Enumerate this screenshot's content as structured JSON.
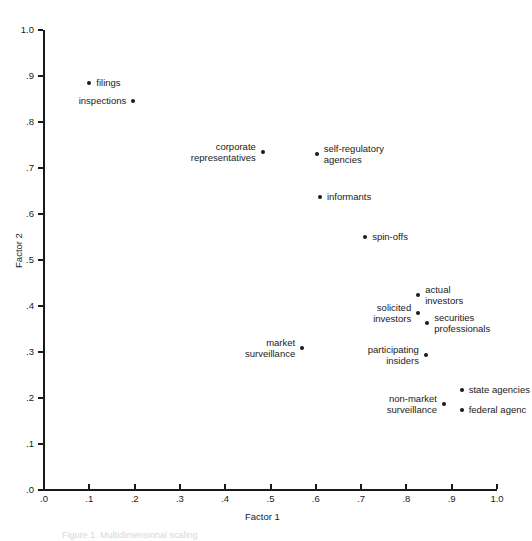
{
  "figure": {
    "caption": "Figure 1. Multidimensional scaling"
  },
  "axes": {
    "x_title": "Factor 1",
    "y_title": "Factor 2",
    "x_ticks": [
      ".0",
      ".1",
      ".2",
      ".3",
      ".4",
      ".5",
      ".6",
      ".7",
      ".8",
      ".9",
      "1.0"
    ],
    "y_ticks": [
      "1.0",
      ".9",
      ".8",
      ".7",
      ".6",
      ".5",
      ".4",
      ".3",
      ".2",
      ".1",
      ".0"
    ],
    "colors": {
      "axis": "#1a1a1a",
      "marker": "#1a1a1a",
      "background": "#ffffff"
    }
  },
  "chart_data": {
    "type": "scatter",
    "title": "",
    "xlabel": "Factor 1",
    "ylabel": "Factor 2",
    "xlim": [
      0.0,
      1.0
    ],
    "ylim": [
      0.0,
      1.0
    ],
    "xticks": [
      0.0,
      0.1,
      0.2,
      0.3,
      0.4,
      0.5,
      0.6,
      0.7,
      0.8,
      0.9,
      1.0
    ],
    "yticks": [
      0.0,
      0.1,
      0.2,
      0.3,
      0.4,
      0.5,
      0.6,
      0.7,
      0.8,
      0.9,
      1.0
    ],
    "grid": false,
    "legend": false,
    "points": [
      {
        "label": "filings",
        "x": 0.1,
        "y": 0.885,
        "label_side": "right",
        "label_lines": [
          "filings"
        ]
      },
      {
        "label": "inspections",
        "x": 0.197,
        "y": 0.845,
        "label_side": "left",
        "label_lines": [
          "inspections"
        ]
      },
      {
        "label": "corporate representatives",
        "x": 0.483,
        "y": 0.735,
        "label_side": "left",
        "label_lines": [
          "corporate",
          "representatives"
        ]
      },
      {
        "label": "self-regulatory agencies",
        "x": 0.602,
        "y": 0.731,
        "label_side": "right",
        "label_lines": [
          "self-regulatory",
          "agencies"
        ]
      },
      {
        "label": "informants",
        "x": 0.609,
        "y": 0.637,
        "label_side": "right",
        "label_lines": [
          "informants"
        ]
      },
      {
        "label": "spin-offs",
        "x": 0.709,
        "y": 0.549,
        "label_side": "right",
        "label_lines": [
          "spin-offs"
        ]
      },
      {
        "label": "actual investors",
        "x": 0.826,
        "y": 0.425,
        "label_side": "right",
        "label_lines": [
          "actual",
          "investors"
        ]
      },
      {
        "label": "solicited investors",
        "x": 0.826,
        "y": 0.385,
        "label_side": "left",
        "label_lines": [
          "solicited",
          "investors"
        ]
      },
      {
        "label": "securities professionals",
        "x": 0.846,
        "y": 0.363,
        "label_side": "right",
        "label_lines": [
          "securities",
          "professionals"
        ]
      },
      {
        "label": "market surveillance",
        "x": 0.57,
        "y": 0.309,
        "label_side": "left",
        "label_lines": [
          "market",
          "surveillance"
        ]
      },
      {
        "label": "participating insiders",
        "x": 0.843,
        "y": 0.293,
        "label_side": "left",
        "label_lines": [
          "participating",
          "insiders"
        ]
      },
      {
        "label": "state agencies",
        "x": 0.922,
        "y": 0.217,
        "label_side": "right",
        "label_lines": [
          "state agencies"
        ]
      },
      {
        "label": "non-market surveillance",
        "x": 0.883,
        "y": 0.188,
        "label_side": "left",
        "label_lines": [
          "non-market",
          "surveillance"
        ]
      },
      {
        "label": "federal agencies",
        "x": 0.922,
        "y": 0.175,
        "label_side": "right",
        "label_lines": [
          "federal agenc"
        ]
      }
    ]
  }
}
